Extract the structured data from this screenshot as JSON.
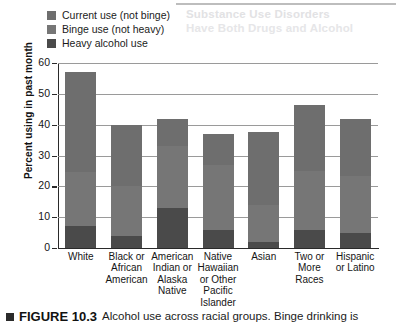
{
  "ghost": {
    "line1": "Substance Use Disorders",
    "line2": "Have Both Drugs and Alcohol"
  },
  "legend": {
    "position": "top-left",
    "items": [
      {
        "label": "Current use (not binge)",
        "color": "#6e6e6e",
        "key": "current"
      },
      {
        "label": "Binge use (not heavy)",
        "color": "#767676",
        "key": "binge"
      },
      {
        "label": "Heavy alcohol use",
        "color": "#4a4a4a",
        "key": "heavy"
      }
    ]
  },
  "caption": {
    "marker": "square-marker",
    "figure_label": "FIGURE 10.3",
    "text": "Alcohol use across racial groups. Binge drinking is"
  },
  "chart_data": {
    "type": "bar",
    "subtype": "stacked-bar",
    "title": "",
    "xlabel": "",
    "ylabel": "Percent using in past month",
    "ylim": [
      0,
      60
    ],
    "yticks": [
      0,
      10,
      20,
      30,
      40,
      50,
      60
    ],
    "grid": true,
    "legend_position": "top-left",
    "categories": [
      "White",
      "Black or African American",
      "American Indian or Alaska Native",
      "Native Hawaiian or Other Pacific Islander",
      "Asian",
      "Two or More Races",
      "Hispanic or Latino"
    ],
    "category_lines": [
      [
        "White"
      ],
      [
        "Black or",
        "African",
        "American"
      ],
      [
        "American",
        "Indian or",
        "Alaska",
        "Native"
      ],
      [
        "Native",
        "Hawaiian",
        "or Other",
        "Pacific",
        "Islander"
      ],
      [
        "Asian"
      ],
      [
        "Two or",
        "More",
        "Races"
      ],
      [
        "Hispanic",
        "or Latino"
      ]
    ],
    "series": [
      {
        "name": "Heavy alcohol use",
        "color": "#4a4a4a",
        "values": [
          7.0,
          4.0,
          13.0,
          6.0,
          2.0,
          6.0,
          5.0
        ]
      },
      {
        "name": "Binge use (not heavy)",
        "color": "#767676",
        "values": [
          17.5,
          16.0,
          20.0,
          21.0,
          12.0,
          19.0,
          18.5
        ]
      },
      {
        "name": "Current use (not binge)",
        "color": "#6e6e6e",
        "values": [
          32.5,
          20.0,
          9.0,
          10.0,
          23.5,
          21.5,
          18.5
        ]
      }
    ],
    "cumulative_tops": {
      "heavy": [
        7.0,
        4.0,
        13.0,
        6.0,
        2.0,
        6.0,
        5.0
      ],
      "binge": [
        24.5,
        20.0,
        33.0,
        27.0,
        14.0,
        25.0,
        23.5
      ],
      "total": [
        57.0,
        40.0,
        42.0,
        37.0,
        37.5,
        46.5,
        42.0
      ]
    }
  }
}
